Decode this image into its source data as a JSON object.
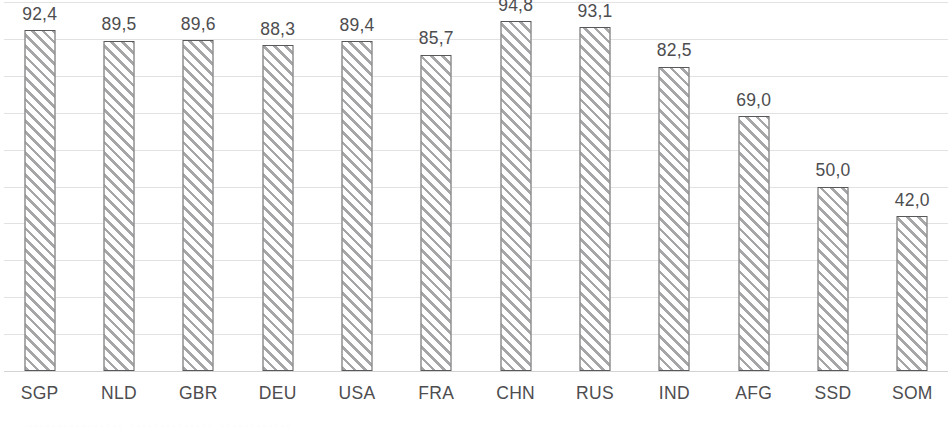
{
  "chart_data": {
    "type": "bar",
    "title": "",
    "subtitle": "",
    "xlabel": "",
    "ylabel": "",
    "categories": [
      "SGP",
      "NLD",
      "GBR",
      "DEU",
      "USA",
      "FRA",
      "CHN",
      "RUS",
      "IND",
      "AFG",
      "SSD",
      "SOM"
    ],
    "values": [
      92.4,
      89.5,
      89.6,
      88.3,
      89.4,
      85.7,
      94.8,
      93.1,
      82.5,
      69.0,
      50.0,
      42.0
    ],
    "value_labels": [
      "92,4",
      "89,5",
      "89,6",
      "88,3",
      "89,4",
      "85,7",
      "94,8",
      "93,1",
      "82,5",
      "69,0",
      "50,0",
      "42,0"
    ],
    "decimal_separator": ",",
    "ylim": [
      0,
      100
    ],
    "y_tick_labels_visible": false,
    "gridlines": {
      "horizontal": true,
      "vertical": false,
      "count": 10,
      "interval": 10,
      "color": "#e2e2e4"
    },
    "legend": {
      "visible": false,
      "position": "none",
      "entries": []
    },
    "bar_style": {
      "fill": "diagonal-hatch",
      "hatch_direction": "forward-slash",
      "hatch_color": "#a6a6a8",
      "background_color": "#ffffff",
      "border_color": "#58585a"
    },
    "axis": {
      "baseline_color": "#d4d4d6",
      "label_color": "#4d4d4f"
    },
    "annotations": {
      "data_labels_shown": true,
      "data_label_position": "outside-end"
    }
  },
  "footer": {
    "clipped_text": "................ .............. ............"
  }
}
